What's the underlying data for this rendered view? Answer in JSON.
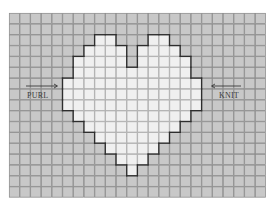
{
  "chart_title": "Heart knitting chart",
  "grid": {
    "cols": 24,
    "rows": 17,
    "origin_x": 9,
    "origin_y": 13,
    "cell_w": 10.7,
    "cell_h": 10.85
  },
  "colors": {
    "background_cell": "#c8c8c8",
    "background_grid": "#8c8c8c",
    "motif_cell": "#f0f0f0",
    "motif_grid": "#aaaaaa",
    "outline": "#2e2e2e",
    "label": "#3a3a3a"
  },
  "motif": {
    "name": "heart",
    "rows": [
      {
        "row": 2,
        "spans": [
          [
            8,
            9
          ],
          [
            13,
            14
          ]
        ]
      },
      {
        "row": 3,
        "spans": [
          [
            7,
            10
          ],
          [
            12,
            15
          ]
        ]
      },
      {
        "row": 4,
        "spans": [
          [
            6,
            10
          ],
          [
            12,
            16
          ]
        ]
      },
      {
        "row": 5,
        "spans": [
          [
            6,
            16
          ]
        ]
      },
      {
        "row": 6,
        "spans": [
          [
            5,
            17
          ]
        ]
      },
      {
        "row": 7,
        "spans": [
          [
            5,
            17
          ]
        ]
      },
      {
        "row": 8,
        "spans": [
          [
            5,
            17
          ]
        ]
      },
      {
        "row": 9,
        "spans": [
          [
            6,
            16
          ]
        ]
      },
      {
        "row": 10,
        "spans": [
          [
            7,
            15
          ]
        ]
      },
      {
        "row": 11,
        "spans": [
          [
            8,
            14
          ]
        ]
      },
      {
        "row": 12,
        "spans": [
          [
            9,
            13
          ]
        ]
      },
      {
        "row": 13,
        "spans": [
          [
            10,
            12
          ]
        ]
      },
      {
        "row": 14,
        "spans": [
          [
            11,
            11
          ]
        ]
      }
    ]
  },
  "labels": {
    "left": {
      "text": "PURL",
      "arrow": "right"
    },
    "right": {
      "text": "KNIT",
      "arrow": "left"
    }
  }
}
